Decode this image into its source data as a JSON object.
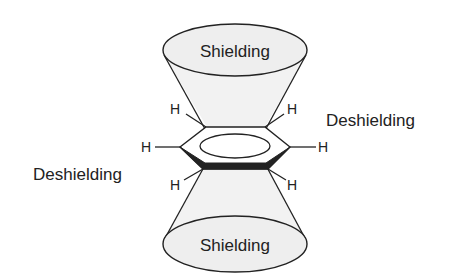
{
  "diagram": {
    "labels": {
      "top_cone": "Shielding",
      "bottom_cone": "Shielding",
      "right_region": "Deshielding",
      "left_region": "Deshielding"
    },
    "atoms": {
      "h_top_left": "H",
      "h_top_right": "H",
      "h_left": "H",
      "h_right": "H",
      "h_bottom_left": "H",
      "h_bottom_right": "H"
    },
    "colors": {
      "cone_fill": "#f0f0f0",
      "ellipse_fill": "#eeeeee",
      "stroke": "#222222",
      "text": "#222222",
      "background": "#ffffff"
    }
  }
}
